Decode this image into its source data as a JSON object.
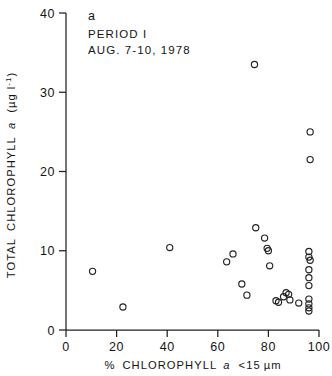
{
  "chart_data": {
    "type": "scatter",
    "title": "",
    "panel_letter": "a",
    "annotations": [
      "PERIOD I",
      "AUG. 7-10, 1978"
    ],
    "xlabel": "% CHLOROPHYLL a <15 μm",
    "ylabel": "TOTAL CHLOROPHYLL a  (μg l⁻¹)",
    "xlim": [
      0,
      100
    ],
    "ylim": [
      0,
      40
    ],
    "xticks": [
      0,
      20,
      40,
      60,
      80,
      100
    ],
    "yticks": [
      0,
      10,
      20,
      30,
      40
    ],
    "xticklabels": [
      "0",
      "20",
      "40",
      "60",
      "80",
      "100"
    ],
    "yticklabels": [
      "0",
      "10",
      "20",
      "30",
      "40"
    ],
    "grid": false,
    "legend": false,
    "marker": "open-circle",
    "points": [
      [
        10.5,
        7.4
      ],
      [
        22.5,
        2.9
      ],
      [
        41.0,
        10.4
      ],
      [
        63.5,
        8.6
      ],
      [
        66.0,
        9.6
      ],
      [
        69.5,
        5.8
      ],
      [
        71.5,
        4.4
      ],
      [
        74.5,
        33.5
      ],
      [
        75.0,
        12.9
      ],
      [
        78.5,
        11.6
      ],
      [
        79.5,
        10.3
      ],
      [
        80.0,
        10.0
      ],
      [
        80.5,
        8.1
      ],
      [
        83.0,
        3.7
      ],
      [
        84.0,
        3.5
      ],
      [
        86.0,
        4.2
      ],
      [
        87.0,
        4.7
      ],
      [
        88.0,
        4.5
      ],
      [
        88.5,
        3.8
      ],
      [
        92.0,
        3.4
      ],
      [
        96.5,
        25.0
      ],
      [
        96.5,
        21.5
      ],
      [
        96.0,
        9.9
      ],
      [
        96.0,
        9.2
      ],
      [
        96.5,
        8.8
      ],
      [
        96.0,
        7.6
      ],
      [
        96.0,
        6.6
      ],
      [
        96.0,
        5.6
      ],
      [
        96.0,
        3.9
      ],
      [
        96.0,
        3.3
      ],
      [
        96.0,
        2.8
      ],
      [
        96.0,
        2.4
      ]
    ]
  }
}
